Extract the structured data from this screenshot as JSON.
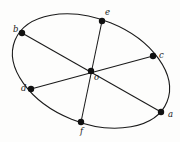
{
  "figure": {
    "name": "ellipse-with-three-diameters",
    "background_color": "#fdfdfc",
    "stroke_color": "#1a1a1a",
    "point_fill_color": "#111111",
    "ellipse": {
      "center_x": 91,
      "center_y": 71,
      "semi_major": 82,
      "semi_minor": 52,
      "rotation_deg": 22
    },
    "points": [
      {
        "id": "a",
        "label": "a",
        "x": 161,
        "y": 112,
        "label_x": 168,
        "label_y": 117
      },
      {
        "id": "b",
        "label": "b",
        "x": 22,
        "y": 33,
        "label_x": 13,
        "label_y": 32
      },
      {
        "id": "c",
        "label": "c",
        "x": 153,
        "y": 56,
        "label_x": 159,
        "label_y": 58
      },
      {
        "id": "d",
        "label": "d",
        "x": 31,
        "y": 89,
        "label_x": 21,
        "label_y": 91
      },
      {
        "id": "e",
        "label": "e",
        "x": 102,
        "y": 21,
        "label_x": 105,
        "label_y": 15
      },
      {
        "id": "f",
        "label": "f",
        "x": 81,
        "y": 122,
        "label_x": 80,
        "label_y": 134
      },
      {
        "id": "o",
        "label": "o",
        "x": 91,
        "y": 71,
        "label_x": 94,
        "label_y": 80
      }
    ],
    "chords": [
      {
        "id": "chord-ba",
        "from": "b",
        "to": "a"
      },
      {
        "id": "chord-dc",
        "from": "d",
        "to": "c"
      },
      {
        "id": "chord-ef",
        "from": "e",
        "to": "f"
      }
    ],
    "ghost_text": [
      {
        "id": "ghost-top-left",
        "text": "",
        "x": 4,
        "y": 44
      },
      {
        "id": "ghost-mid-left",
        "text": "",
        "x": 6,
        "y": 86
      },
      {
        "id": "ghost-bottom-left",
        "text": "",
        "x": 3,
        "y": 126
      },
      {
        "id": "ghost-bottom-mid",
        "text": "",
        "x": 100,
        "y": 133
      }
    ]
  }
}
